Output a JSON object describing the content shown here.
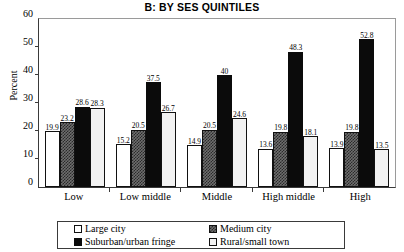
{
  "chart_data": {
    "type": "bar",
    "title": "B: BY SES QUINTILES",
    "xlabel": "",
    "ylabel": "Percent",
    "ylim": [
      0,
      60
    ],
    "yticks": [
      0,
      10,
      20,
      30,
      40,
      50,
      60
    ],
    "grid": false,
    "legend_position": "bottom",
    "categories": [
      "Low",
      "Low middle",
      "Middle",
      "High middle",
      "High"
    ],
    "series": [
      {
        "name": "Large city",
        "swatch": "#ffffff",
        "values": [
          19.9,
          15.2,
          14.9,
          13.6,
          13.9
        ]
      },
      {
        "name": "Medium city",
        "swatch": "#6e6e6e",
        "values": [
          23.2,
          20.5,
          20.5,
          19.8,
          19.8
        ]
      },
      {
        "name": "Suburban/urban fringe",
        "swatch": "#0b0b0b",
        "values": [
          28.6,
          37.5,
          40.0,
          48.3,
          52.8
        ]
      },
      {
        "name": "Rural/small town",
        "swatch": "#f2f2f2",
        "values": [
          28.3,
          26.7,
          24.6,
          18.1,
          13.5
        ]
      }
    ],
    "data_labels": [
      [
        "19.9",
        "23.2",
        "28.6",
        "28.3"
      ],
      [
        "15.2",
        "20.5",
        "37.5",
        "26.7"
      ],
      [
        "14.9",
        "20.5",
        "40",
        "24.6"
      ],
      [
        "13.6",
        "19.8",
        "48.3",
        "18.1"
      ],
      [
        "13.9",
        "19.8",
        "52.8",
        "13.5"
      ]
    ]
  }
}
